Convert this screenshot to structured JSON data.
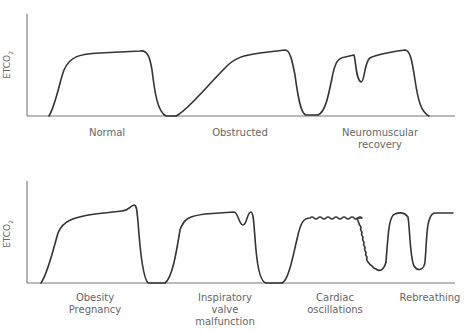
{
  "figure": {
    "top_panel": {
      "y_axis_label": "ETCO",
      "y_axis_label_sub": "2",
      "waveforms": [
        {
          "label_line1": "Normal",
          "label_line2": ""
        },
        {
          "label_line1": "Obstructed",
          "label_line2": ""
        },
        {
          "label_line1": "Neuromuscular",
          "label_line2": "recovery"
        }
      ]
    },
    "bottom_panel": {
      "y_axis_label": "ETCO",
      "y_axis_label_sub": "2",
      "waveforms": [
        {
          "label_line1": "Obesity",
          "label_line2": "Pregnancy",
          "label_line3": ""
        },
        {
          "label_line1": "Inspiratory",
          "label_line2": "valve",
          "label_line3": "malfunction"
        },
        {
          "label_line1": "Cardiac",
          "label_line2": "oscillations",
          "label_line3": ""
        },
        {
          "label_line1": "Rebreathing",
          "label_line2": "",
          "label_line3": ""
        }
      ]
    }
  }
}
